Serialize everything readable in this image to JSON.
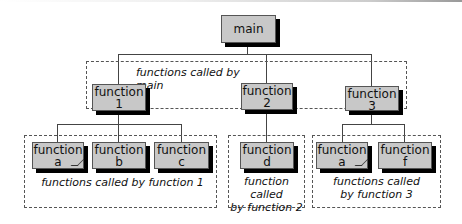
{
  "diagram": {
    "root": {
      "line1": "main"
    },
    "level1_group_caption": "functions called by main",
    "level1": [
      {
        "line1": "function",
        "line2": "1"
      },
      {
        "line1": "function",
        "line2": "2"
      },
      {
        "line1": "function",
        "line2": "3"
      }
    ],
    "groups": [
      {
        "caption": "functions called by function 1",
        "children": [
          {
            "line1": "function",
            "line2": "a"
          },
          {
            "line1": "function",
            "line2": "b"
          },
          {
            "line1": "function",
            "line2": "c"
          }
        ]
      },
      {
        "caption_line1": "function called",
        "caption_line2": "by function 2",
        "children": [
          {
            "line1": "function",
            "line2": "d"
          }
        ]
      },
      {
        "caption_line1": "functions called",
        "caption_line2": "by function 3",
        "children": [
          {
            "line1": "function",
            "line2": "a"
          },
          {
            "line1": "function",
            "line2": "f"
          }
        ]
      }
    ]
  }
}
